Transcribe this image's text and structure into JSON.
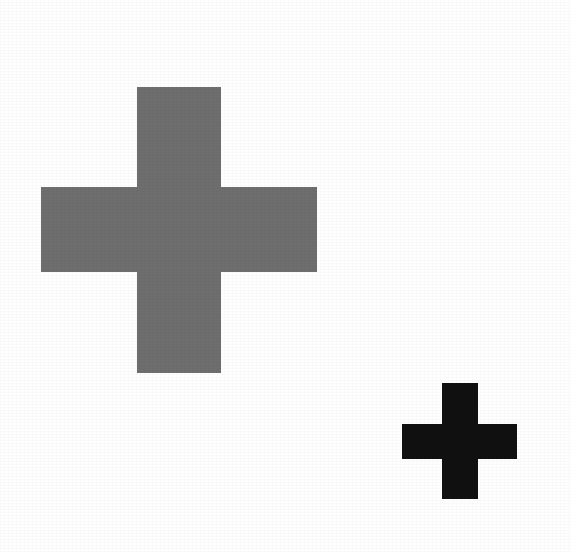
{
  "image": {
    "title": "Two Greek Crosses",
    "description": "A large gray plus/cross shape in the upper left and a small black plus/cross shape in the lower right on a white background.",
    "background_color": "#fefefe",
    "width": 571,
    "height": 552,
    "medium": "scanned-print"
  },
  "shapes": [
    {
      "id": "cross-large",
      "name": "large-gray-cross",
      "label": "Large gray cross",
      "type": "greek-cross",
      "color": "#6e6e6e",
      "bbox": {
        "x": 41,
        "y": 87,
        "width": 276,
        "height": 286
      },
      "arm_thickness": 84,
      "vertical_bar": {
        "x": 137,
        "y": 87,
        "width": 84,
        "height": 286
      },
      "horizontal_bar": {
        "x": 41,
        "y": 187,
        "width": 276,
        "height": 85
      },
      "center": {
        "x": 179,
        "y": 230
      }
    },
    {
      "id": "cross-small",
      "name": "small-black-cross",
      "label": "Small black cross",
      "type": "greek-cross",
      "color": "#101010",
      "bbox": {
        "x": 402,
        "y": 383,
        "width": 115,
        "height": 116
      },
      "arm_thickness": 36,
      "vertical_bar": {
        "x": 442,
        "y": 383,
        "width": 36,
        "height": 116
      },
      "horizontal_bar": {
        "x": 402,
        "y": 424,
        "width": 115,
        "height": 35
      },
      "center": {
        "x": 460,
        "y": 441
      }
    }
  ]
}
